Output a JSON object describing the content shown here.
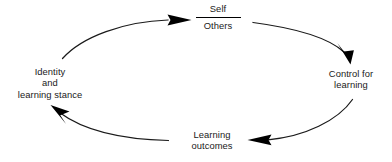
{
  "diagram": {
    "type": "cycle",
    "background_color": "#ffffff",
    "stroke_color": "#1a1a1a",
    "text_color": "#1a1a1a",
    "nodes": [
      {
        "id": "self-others",
        "kind": "fraction",
        "numerator": "Self",
        "denominator": "Others",
        "position": "top"
      },
      {
        "id": "control",
        "kind": "text",
        "lines": [
          "Control for",
          "learning"
        ],
        "position": "right"
      },
      {
        "id": "outcomes",
        "kind": "text",
        "lines": [
          "Learning",
          "outcomes"
        ],
        "position": "bottom"
      },
      {
        "id": "identity",
        "kind": "text",
        "lines": [
          "Identity",
          "and",
          "learning stance"
        ],
        "position": "left"
      }
    ],
    "arrows": [
      {
        "id": "identity-to-self-others",
        "from": "identity",
        "to": "self-others",
        "direction": "clockwise",
        "arrowhead": "end"
      },
      {
        "id": "self-others-to-control",
        "from": "self-others",
        "to": "control",
        "direction": "clockwise",
        "arrowhead": "end"
      },
      {
        "id": "control-to-outcomes",
        "from": "control",
        "to": "outcomes",
        "direction": "clockwise",
        "arrowhead": "end"
      },
      {
        "id": "outcomes-to-identity",
        "from": "outcomes",
        "to": "identity",
        "direction": "clockwise",
        "arrowhead": "end"
      }
    ]
  }
}
